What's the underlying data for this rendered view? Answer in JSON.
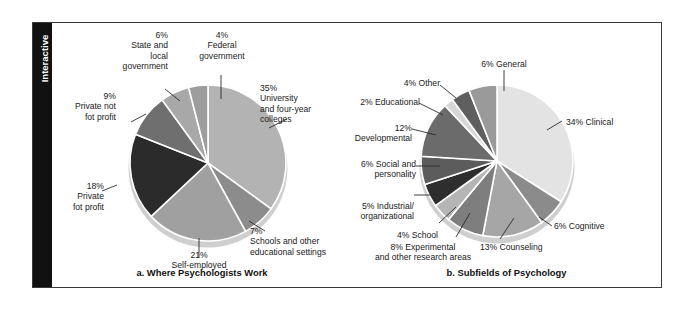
{
  "sidebar": {
    "tab_label": "Interactive"
  },
  "chart_data": [
    {
      "type": "pie",
      "id": "where-psychologists-work",
      "title": "a. Where Psychologists Work",
      "start_angle_deg": 0,
      "direction": "clockwise",
      "legend": "labels-outside",
      "grid": false,
      "labels": [
        "35%\nUniversity\nand four-year\ncolleges",
        "7%\nSchools and other\neducational settings",
        "21%\nSelf-employed",
        "18%\nPrivate\nfot profit",
        "9%\nPrivate not\nfot profit",
        "6%\nState and\nlocal\ngovernment",
        "4%\nFederal\ngovernment"
      ],
      "categories": [
        "University and four-year colleges",
        "Schools and other educational settings",
        "Self-employed",
        "Private fot profit",
        "Private not fot profit",
        "State and local government",
        "Federal government"
      ],
      "values": [
        35,
        7,
        21,
        18,
        9,
        6,
        4
      ],
      "colors": [
        "#b3b3b3",
        "#8c8c8c",
        "#a0a0a0",
        "#2b2b2b",
        "#6f6f6f",
        "#a8a8a8",
        "#9d9d9d"
      ]
    },
    {
      "type": "pie",
      "id": "subfields-of-psychology",
      "title": "b. Subfields of Psychology",
      "start_angle_deg": 0,
      "direction": "clockwise",
      "legend": "labels-outside",
      "grid": false,
      "labels": [
        "34% Clinical",
        "6% Cognitive",
        "13% Counseling",
        "8% Experimental\nand other research areas",
        "4% School",
        "5% Industrial/\norganizational",
        "6% Social and\npersonality",
        "12% Developmental",
        "2% Educational",
        "4% Other",
        "6% General"
      ],
      "categories": [
        "Clinical",
        "Cognitive",
        "Counseling",
        "Experimental and other research areas",
        "School",
        "Industrial/organizational",
        "Social and personality",
        "Developmental",
        "Educational",
        "Other",
        "General"
      ],
      "values": [
        34,
        6,
        13,
        8,
        4,
        5,
        6,
        12,
        2,
        4,
        6
      ],
      "colors": [
        "#e3e3e3",
        "#8b8b8b",
        "#a6a6a6",
        "#7e7e7e",
        "#b5b5b5",
        "#2e2e2e",
        "#5c5c5c",
        "#6b6b6b",
        "#d6d6d6",
        "#5f5f5f",
        "#9a9a9a"
      ]
    }
  ]
}
